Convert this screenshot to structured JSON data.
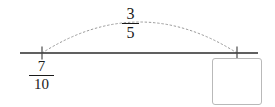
{
  "problem": {
    "type": "number-line-addition-jump",
    "colors": {
      "line": "#2b2b2b",
      "tick": "#4a4a4a",
      "arc": "#9a9a9a",
      "text": "#1a1a1a",
      "box_border": "#b9b9b9",
      "background": "#ffffff"
    }
  },
  "number_line": {
    "name": "number-line",
    "axis_start_x": 20,
    "axis_end_x": 258,
    "axis_y": 53,
    "ticks": [
      {
        "name": "start-tick",
        "x": 42,
        "label": "7/10"
      },
      {
        "name": "end-tick",
        "x": 237,
        "label": ""
      }
    ]
  },
  "start_value": {
    "label": "7/10",
    "numerator": "7",
    "denominator": "10"
  },
  "jump": {
    "label": "3/5",
    "numerator": "3",
    "denominator": "5",
    "arc_style": "dotted",
    "from_x": 42,
    "to_x": 237,
    "peak_y": 22
  },
  "answer": {
    "value": "",
    "placeholder": ""
  }
}
